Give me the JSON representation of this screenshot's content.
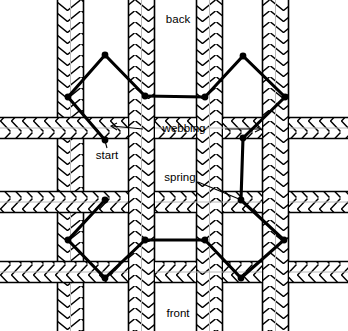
{
  "figure": {
    "type": "diagram",
    "background_color": "#ffffff",
    "line_color": "#000000",
    "strap_fill": "#ffffff",
    "width": 348,
    "height": 331
  },
  "labels": [
    {
      "id": "back",
      "text": "back",
      "x": 178,
      "y": 20,
      "anchor": "middle"
    },
    {
      "id": "webbing",
      "text": "webbing",
      "x": 184,
      "y": 129,
      "anchor": "middle"
    },
    {
      "id": "start",
      "text": "start",
      "x": 107,
      "y": 156,
      "anchor": "middle"
    },
    {
      "id": "spring",
      "text": "spring",
      "x": 180,
      "y": 178,
      "anchor": "middle"
    },
    {
      "id": "front",
      "text": "front",
      "x": 178,
      "y": 314,
      "anchor": "middle"
    }
  ],
  "vertical_straps": [
    {
      "id": "v1",
      "x": 57,
      "width": 27
    },
    {
      "id": "v2",
      "x": 128,
      "width": 27
    },
    {
      "id": "v3",
      "x": 196,
      "width": 27
    },
    {
      "id": "v4",
      "x": 262,
      "width": 27
    }
  ],
  "horizontal_straps": [
    {
      "id": "h1",
      "y": 44,
      "height": 22
    },
    {
      "id": "h2",
      "y": 117,
      "height": 22
    },
    {
      "id": "h3",
      "y": 191,
      "height": 22
    },
    {
      "id": "h4",
      "y": 261,
      "height": 22
    }
  ],
  "springs": [
    {
      "id": "spring-top-left",
      "points": "105,140 68,97 105,55 145,96",
      "nodes": [
        {
          "x": 105,
          "y": 140
        },
        {
          "x": 68,
          "y": 97
        },
        {
          "x": 105,
          "y": 55
        },
        {
          "x": 145,
          "y": 96
        }
      ]
    },
    {
      "id": "spring-top-connector",
      "points": "145,96 205,97"
    },
    {
      "id": "spring-top-right",
      "points": "205,97 243,56 285,97 243,138"
    },
    {
      "id": "spring-right-vertical",
      "points": "243,138 241,200"
    },
    {
      "id": "spring-bottom-right",
      "points": "241,200 284,240 241,278 205,240"
    },
    {
      "id": "spring-bottom-connector",
      "points": "205,240 145,240"
    },
    {
      "id": "spring-bottom-left",
      "points": "145,240 105,278 68,240 105,200"
    }
  ],
  "leader_lines": [
    {
      "id": "webbing-leader-left",
      "from": {
        "x": 143,
        "y": 129
      },
      "to": {
        "x": 108,
        "y": 124
      }
    },
    {
      "id": "webbing-leader-right",
      "from": {
        "x": 225,
        "y": 129
      },
      "to": {
        "x": 263,
        "y": 129
      }
    },
    {
      "id": "spring-leader",
      "from": {
        "x": 197,
        "y": 182
      },
      "to": {
        "x": 239,
        "y": 199
      }
    },
    {
      "id": "start-leader",
      "from": {
        "x": 107,
        "y": 148
      },
      "to": {
        "x": 105,
        "y": 140
      }
    }
  ]
}
